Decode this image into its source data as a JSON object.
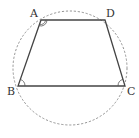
{
  "diagram": {
    "colors": {
      "background": "#ffffff",
      "trapezoid_stroke": "#444444",
      "circle_stroke": "#888888",
      "angle_marks": "#555555",
      "labels": "#333333"
    },
    "circle": {
      "cx": 70,
      "cy": 68,
      "r": 57,
      "style": "dashed"
    },
    "vertices": [
      {
        "name": "A",
        "x": 41,
        "y": 20,
        "label_x": 30,
        "label_y": 17
      },
      {
        "name": "D",
        "x": 105,
        "y": 20,
        "label_x": 106,
        "label_y": 17
      },
      {
        "name": "C",
        "x": 125,
        "y": 86,
        "label_x": 127,
        "label_y": 95
      },
      {
        "name": "B",
        "x": 18,
        "y": 86,
        "label_x": 7,
        "label_y": 95
      }
    ],
    "edges": [
      [
        "A",
        "D"
      ],
      [
        "D",
        "C"
      ],
      [
        "C",
        "B"
      ],
      [
        "B",
        "A"
      ]
    ],
    "angle_marks": [
      {
        "vertex": "A",
        "type": "double-arc"
      },
      {
        "vertex": "B",
        "type": "single-arc"
      },
      {
        "vertex": "C",
        "type": "single-arc"
      }
    ],
    "labels": {
      "A": "A",
      "B": "B",
      "C": "C",
      "D": "D"
    }
  }
}
